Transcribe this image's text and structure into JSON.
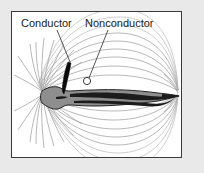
{
  "figure": {
    "domain": "Diagram",
    "panel": {
      "background_color": "#ffffff",
      "border_color": "#3a3a3a",
      "outer_background_color": "#e9e9e9"
    },
    "labels": [
      {
        "id": "conductor",
        "text": "Conductor",
        "x": 20,
        "y": 24,
        "leader_from": [
          56,
          28
        ],
        "leader_to": [
          59,
          52
        ]
      },
      {
        "id": "nonconductor",
        "text": "Nonconductor",
        "x": 84,
        "y": 24,
        "leader_from": [
          96,
          28
        ],
        "leader_to": [
          76,
          66
        ]
      }
    ],
    "objects": [
      {
        "id": "conductor-rod",
        "name": "conductor",
        "shape": "tapered-black-rod",
        "color": "#0a0a0a",
        "from": [
          59,
          51
        ],
        "to": [
          53,
          82
        ]
      },
      {
        "id": "nonconductor-circle",
        "name": "nonconductor",
        "shape": "small-circle",
        "color": "#ffffff",
        "outline": "#3a3a3a",
        "center": [
          75,
          69
        ],
        "radius": 3.5
      },
      {
        "id": "fish",
        "name": "electric-fish",
        "shape": "elongated-body-with-tapering-tail",
        "body_color": "#8e8e8e",
        "outline_color": "#222222",
        "head_x": 40,
        "tail_x": 176,
        "midline_y": 91
      }
    ],
    "field": {
      "type": "dipole-field-lines",
      "line_color": "#9a9a9a",
      "description": "Field lines radiate from the head at the left and converge on the tail at the right, forming nested arcs above and below the fish.",
      "line_count": 34
    }
  }
}
